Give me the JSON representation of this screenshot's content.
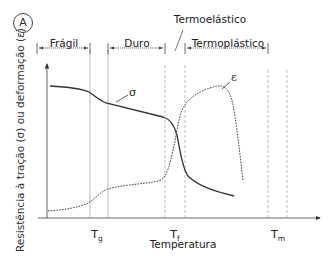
{
  "panel": {
    "letter": "A"
  },
  "regions": [
    {
      "label": "Frágil",
      "x_start": 47,
      "x_end": 90
    },
    {
      "label": "Duro",
      "x_start": 108,
      "x_end": 165
    },
    {
      "label": "Termoelástico",
      "x_start": 165,
      "x_end": 185
    },
    {
      "label": "Termoplástico",
      "x_start": 185,
      "x_end": 268
    }
  ],
  "axes": {
    "ylabel": "Resistência à tração (σ) ou deformação (ε)",
    "xlabel": "Temperatura",
    "ticks": [
      {
        "main": "T",
        "sub": "g"
      },
      {
        "main": "T",
        "sub": "f"
      },
      {
        "main": "T",
        "sub": "m"
      }
    ]
  },
  "curves": {
    "sigma": {
      "label": "σ",
      "style": "solid"
    },
    "epsilon": {
      "label": "ε",
      "style": "dotted"
    }
  },
  "colors": {
    "line": "#333333",
    "guide": "#aaaaaa"
  }
}
